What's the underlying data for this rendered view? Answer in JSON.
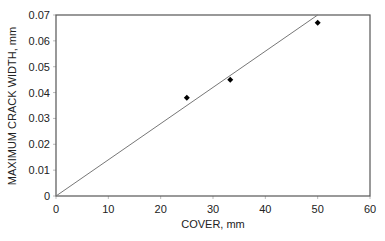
{
  "chart_data": {
    "type": "scatter",
    "title": "",
    "xlabel": "COVER, mm",
    "ylabel": "MAXIMUM CRACK WIDTH, mm",
    "xlim": [
      0,
      60
    ],
    "ylim": [
      0,
      0.07
    ],
    "x_ticks": [
      0,
      10,
      20,
      30,
      40,
      50,
      60
    ],
    "y_ticks": [
      0,
      0.01,
      0.02,
      0.03,
      0.04,
      0.05,
      0.06,
      0.07
    ],
    "x_tick_labels": [
      "0",
      "10",
      "20",
      "30",
      "40",
      "50",
      "60"
    ],
    "y_tick_labels": [
      "0",
      "0.01",
      "0.02",
      "0.03",
      "0.04",
      "0.05",
      "0.06",
      "0.07"
    ],
    "grid": false,
    "legend": null,
    "series": [
      {
        "name": "Measured",
        "marker": "diamond",
        "color": "#000000",
        "x": [
          25,
          33.3,
          50
        ],
        "y": [
          0.038,
          0.045,
          0.067
        ]
      },
      {
        "name": "Trend line",
        "kind": "line",
        "color": "#777777",
        "x": [
          0,
          50
        ],
        "y": [
          0,
          0.07
        ]
      }
    ]
  },
  "colors": {
    "axis": "#555555",
    "marker": "#000000",
    "trendline": "#777777",
    "text": "#222222"
  }
}
